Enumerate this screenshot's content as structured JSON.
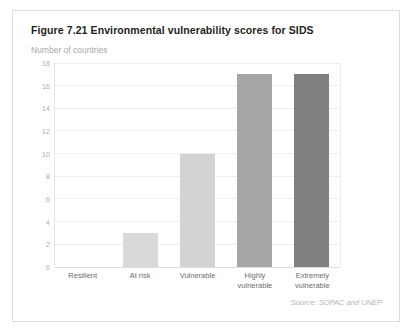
{
  "figure": {
    "title": "Figure 7.21 Environmental vulnerability scores for SIDS",
    "axis_subtitle": "Number of countries",
    "source": "Source: SOPAC and UNEP"
  },
  "chart_data": {
    "type": "bar",
    "title": "Figure 7.21 Environmental vulnerability scores for SIDS",
    "subtitle": "Number of countries",
    "categories": [
      "Resilient",
      "At risk",
      "Vulnerable",
      "Highly vulnerable",
      "Extremely vulnerable"
    ],
    "category_lines": [
      [
        "Resilient"
      ],
      [
        "At risk"
      ],
      [
        "Vulnerable"
      ],
      [
        "Highly",
        "vulnerable"
      ],
      [
        "Extremely",
        "vulnerable"
      ]
    ],
    "values": [
      0,
      3,
      10,
      17,
      17
    ],
    "bar_colors": [
      "#ffffff",
      "#d9d9d9",
      "#d3d3d3",
      "#a6a6a6",
      "#808080"
    ],
    "xlabel": "",
    "ylabel": "Number of countries",
    "ylim": [
      0,
      18
    ],
    "ytick_step": 2,
    "yticks": [
      18,
      16,
      14,
      12,
      10,
      8,
      6,
      4,
      2,
      0
    ],
    "grid": true,
    "legend": false,
    "annotations": [
      "Source: SOPAC and UNEP"
    ]
  }
}
